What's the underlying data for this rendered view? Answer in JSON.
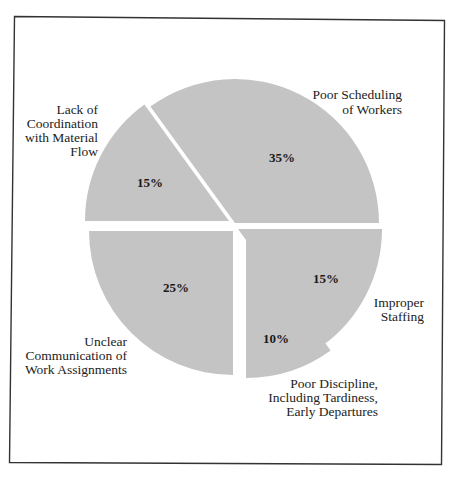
{
  "chart_data": {
    "type": "pie",
    "title": "",
    "exploded": true,
    "slice_color": "#c4c4c4",
    "frame_color": "#333333",
    "categories": [
      "Poor Scheduling of Workers",
      "Lack of Coordination with Material Flow",
      "Unclear Communication of Work Assignments",
      "Poor Discipline, Including Tardiness, Early Departures",
      "Improper Staffing"
    ],
    "values": [
      35,
      15,
      25,
      10,
      15
    ],
    "slices": [
      {
        "label": "Poor Scheduling of Workers",
        "label_lines": [
          "Poor Scheduling",
          "of Workers"
        ],
        "value": 35,
        "value_label": "35%"
      },
      {
        "label": "Lack of Coordination with Material Flow",
        "label_lines": [
          "Lack of",
          "Coordination",
          "with Material",
          "Flow"
        ],
        "value": 15,
        "value_label": "15%"
      },
      {
        "label": "Unclear Communication of Work Assignments",
        "label_lines": [
          "Unclear",
          "Communication of",
          "Work Assignments"
        ],
        "value": 25,
        "value_label": "25%"
      },
      {
        "label": "Poor Discipline, Including Tardiness, Early Departures",
        "label_lines": [
          "Poor Discipline,",
          "Including Tardiness,",
          "Early Departures"
        ],
        "value": 10,
        "value_label": "10%"
      },
      {
        "label": "Improper Staffing",
        "label_lines": [
          "Improper",
          "Staffing"
        ],
        "value": 15,
        "value_label": "15%"
      }
    ]
  },
  "labels": {
    "poor_scheduling": "Poor Scheduling\nof Workers",
    "lack_coordination": "Lack of\nCoordination\nwith Material\nFlow",
    "unclear_communication": "Unclear\nCommunication of\nWork Assignments",
    "poor_discipline": "Poor Discipline,\nIncluding Tardiness,\nEarly Departures",
    "improper_staffing": "Improper\nStaffing"
  },
  "values": {
    "poor_scheduling": "35%",
    "lack_coordination": "15%",
    "unclear_communication": "25%",
    "poor_discipline": "10%",
    "improper_staffing": "15%"
  }
}
